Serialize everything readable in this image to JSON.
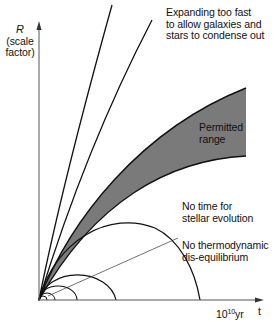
{
  "figure": {
    "y_axis": {
      "symbol": "R",
      "label_line1": "(scale",
      "label_line2": "factor)"
    },
    "x_axis": {
      "tick_base": "10",
      "tick_exponent": "10",
      "tick_unit": "yr",
      "symbol": "t"
    },
    "annotations": {
      "expanding_line1": "Expanding too fast",
      "expanding_line2": "to allow galaxies and",
      "expanding_line3": "stars to condense out",
      "permitted_line1": "Permitted",
      "permitted_line2": "range",
      "stellar_line1": "No time for",
      "stellar_line2": "stellar evolution",
      "thermo_line1": "No thermodynamic",
      "thermo_line2": "dis-equilibrium"
    },
    "colors": {
      "ink": "#111111",
      "band_fill": "#7a7a7a",
      "axis": "#555555"
    }
  }
}
